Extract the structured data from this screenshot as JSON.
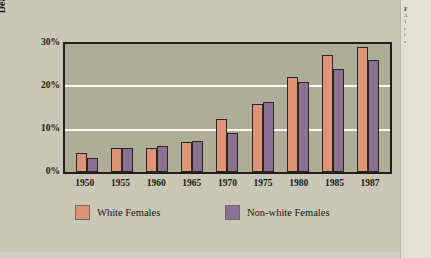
{
  "chart_data": {
    "type": "bar",
    "title": "",
    "xlabel": "",
    "ylabel": "Deaths per 100,000 Women",
    "ylim": [
      0,
      30
    ],
    "ytick_labels": [
      "0%",
      "10%",
      "20%",
      "30%"
    ],
    "ytick_values": [
      0,
      10,
      20,
      30
    ],
    "grid": true,
    "legend_position": "bottom",
    "categories": [
      "1950",
      "1955",
      "1960",
      "1965",
      "1970",
      "1975",
      "1980",
      "1985",
      "1987"
    ],
    "series": [
      {
        "name": "White Females",
        "color": "#dd9477",
        "values": [
          4.4,
          5.6,
          5.7,
          7.1,
          12.4,
          16.0,
          22.2,
          27.5,
          29.3
        ]
      },
      {
        "name": "Non-white Females",
        "color": "#8a7191",
        "values": [
          3.3,
          5.6,
          6.0,
          7.2,
          9.1,
          16.4,
          21.2,
          24.2,
          26.2
        ]
      }
    ]
  },
  "axis": {
    "y_title": "Deaths per 100,000 Women"
  },
  "caption_strip": {
    "lines": [
      "F",
      "A",
      "1",
      "t",
      "l",
      "s"
    ]
  }
}
